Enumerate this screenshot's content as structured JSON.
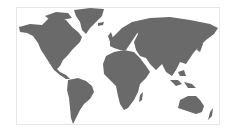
{
  "map": {
    "type": "world-map",
    "projection": "equirectangular-like",
    "land_color": "#6a6a6a",
    "background_color": "#ffffff",
    "border_color": "#e6e6e6",
    "regions": [
      "North America",
      "Greenland",
      "South America",
      "Europe",
      "Africa",
      "Asia",
      "Australia",
      "New Zealand",
      "Southeast Asia islands"
    ]
  }
}
